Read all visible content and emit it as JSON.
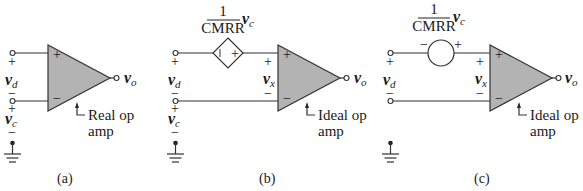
{
  "panels": [
    {
      "id": "a",
      "caption": "(a)",
      "opamp_label_line1": "Real op",
      "opamp_label_line2": "amp",
      "input_plus": "+",
      "input_minus": "−",
      "vd_symbol": "v",
      "vd_sub": "d",
      "vc_symbol": "v",
      "vc_sub": "c",
      "vo_symbol": "v",
      "vo_sub": "o",
      "vd_plus": "+",
      "vd_minus": "−",
      "vc_plus": "+",
      "vc_minus": "−"
    },
    {
      "id": "b",
      "caption": "(b)",
      "opamp_label_line1": "Ideal op",
      "opamp_label_line2": "amp",
      "source_type": "dependent-voltage-source",
      "source_minus": "−",
      "source_plus": "+",
      "gain_numerator": "1",
      "gain_denominator": "CMRR",
      "gain_var": "v",
      "gain_sub": "c",
      "input_plus": "+",
      "input_minus": "−",
      "vx_symbol": "v",
      "vx_sub": "x",
      "vx_plus": "+",
      "vx_minus": "−",
      "vd_symbol": "v",
      "vd_sub": "d",
      "vc_symbol": "v",
      "vc_sub": "c",
      "vo_symbol": "v",
      "vo_sub": "o",
      "vd_plus": "+",
      "vd_minus": "−",
      "vc_plus": "+",
      "vc_minus": "−"
    },
    {
      "id": "c",
      "caption": "(c)",
      "opamp_label_line1": "Ideal op",
      "opamp_label_line2": "amp",
      "source_type": "independent-voltage-source",
      "source_minus": "−",
      "source_plus": "+",
      "gain_numerator": "1",
      "gain_denominator": "CMRR",
      "gain_var": "v",
      "gain_sub": "c",
      "input_plus": "+",
      "input_minus": "−",
      "vx_symbol": "v",
      "vx_sub": "x",
      "vx_plus": "+",
      "vx_minus": "−",
      "vd_symbol": "v",
      "vd_sub": "d",
      "vo_symbol": "v",
      "vo_sub": "o",
      "vd_plus": "+",
      "vd_minus": "−"
    }
  ]
}
